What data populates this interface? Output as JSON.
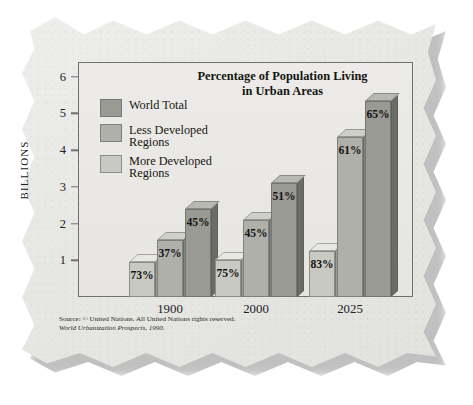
{
  "chart_data": {
    "type": "bar",
    "title": "Percentage of Population Living in Urban Areas",
    "title_line1": "Percentage of Population Living",
    "title_line2": "in Urban Areas",
    "xlabel": "",
    "ylabel": "BILLIONS",
    "ylim": [
      0,
      6.4
    ],
    "yticks": [
      1,
      2,
      3,
      4,
      5,
      6
    ],
    "ytick_labels": [
      "1",
      "2",
      "3",
      "4",
      "5",
      "6"
    ],
    "grid": false,
    "legend_position": "upper-left-inside",
    "categories": [
      "1900",
      "2000",
      "2025"
    ],
    "series": [
      {
        "name": "More Developed Regions",
        "color": "#c9c9c4",
        "values": [
          0.95,
          1.0,
          1.25
        ],
        "labels": [
          "73%",
          "75%",
          "83%"
        ]
      },
      {
        "name": "Less Developed Regions",
        "color": "#b0b0ab",
        "values": [
          1.55,
          2.1,
          4.35
        ],
        "labels": [
          "37%",
          "45%",
          "61%"
        ]
      },
      {
        "name": "World Total",
        "color": "#9a9a95",
        "values": [
          2.4,
          3.1,
          5.35
        ],
        "labels": [
          "45%",
          "51%",
          "65%"
        ]
      }
    ],
    "legend_order": [
      "World Total",
      "Less Developed Regions",
      "More Developed Regions"
    ],
    "annotations": {
      "source_line1": "Source: © United Nations. All United Nations rights reserved.",
      "source_line2": "World Urbanization Prospects, 1990."
    }
  },
  "legend": {
    "items": [
      {
        "label_line1": "World Total",
        "label_line2": "",
        "color": "#9a9a95"
      },
      {
        "label_line1": "Less Developed",
        "label_line2": "Regions",
        "color": "#b0b0ab"
      },
      {
        "label_line1": "More Developed",
        "label_line2": "Regions",
        "color": "#c9c9c4"
      }
    ]
  }
}
